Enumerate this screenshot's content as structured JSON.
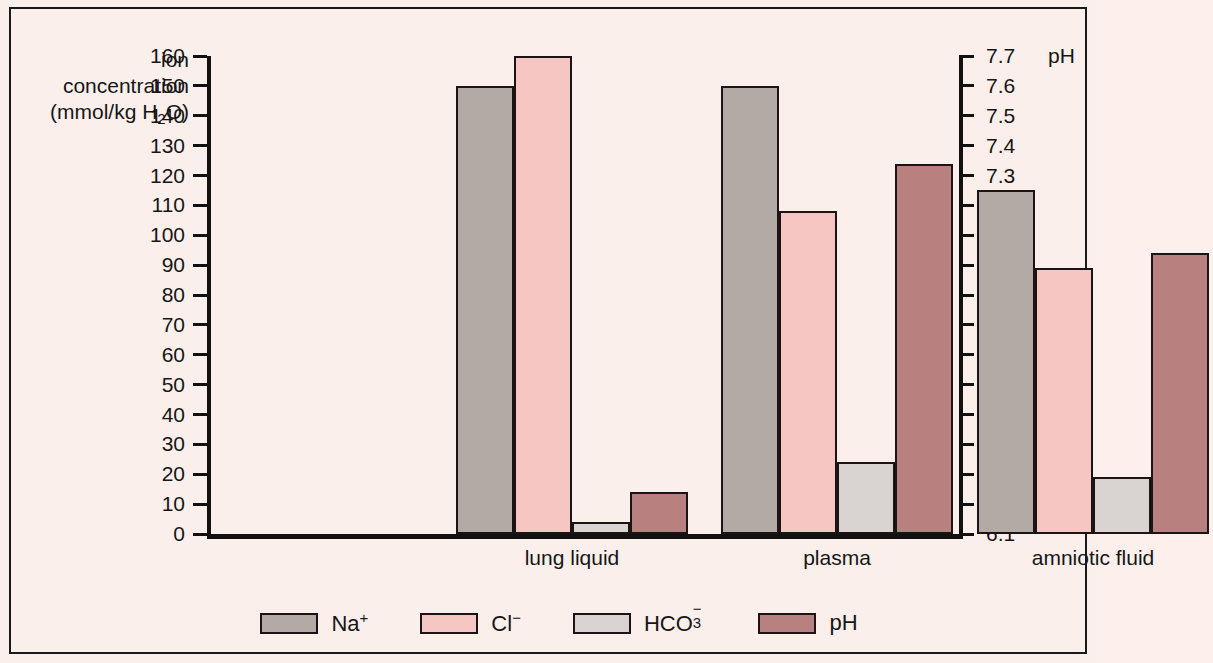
{
  "axes": {
    "left_label_line1": "ion",
    "left_label_line2": "concentration",
    "left_label_line3_pre": "(mmol/kg H",
    "left_label_line3_sub": "2",
    "left_label_line3_post": "O)",
    "right_label": "pH"
  },
  "legend": {
    "items": [
      {
        "name": "Na",
        "sup": "+",
        "sub": "",
        "color": "#b3aaa6"
      },
      {
        "name": "Cl",
        "sup": "−",
        "sub": "",
        "color": "#f6c6c3"
      },
      {
        "name": "HCO",
        "sup": "−",
        "sub": "3",
        "color": "#d9d4d2"
      },
      {
        "name": "pH",
        "sup": "",
        "sub": "",
        "color": "#b8807f"
      }
    ]
  },
  "chart_data": {
    "type": "bar",
    "title": "",
    "xlabel": "",
    "ylabel": "ion concentration (mmol/kg H2O)",
    "y2label": "pH",
    "grid": false,
    "legend_position": "bottom",
    "categories": [
      "lung liquid",
      "plasma",
      "amniotic fluid"
    ],
    "ylim": [
      0,
      160
    ],
    "y_ticks": [
      0,
      10,
      20,
      30,
      40,
      50,
      60,
      70,
      80,
      90,
      100,
      110,
      120,
      130,
      140,
      150,
      160
    ],
    "y_tick_labels": [
      "0",
      "10",
      "20",
      "30",
      "40",
      "50",
      "60",
      "70",
      "80",
      "90",
      "100",
      "110",
      "120",
      "130",
      "140",
      "150",
      "160"
    ],
    "y2lim": [
      6.1,
      7.7
    ],
    "y2_ticks": [
      6.1,
      6.2,
      6.3,
      6.4,
      6.5,
      6.6,
      6.7,
      6.8,
      6.9,
      7.0,
      7.1,
      7.2,
      7.3,
      7.4,
      7.5,
      7.6,
      7.7
    ],
    "y2_tick_labels": [
      "6.1",
      "6.2",
      "6.3",
      "6.4",
      "6.5",
      "6.6",
      "6.7",
      "6.8",
      "6.9",
      "7.0",
      "7.1",
      "7.2",
      "7.3",
      "7.4",
      "7.5",
      "7.6",
      "7.7"
    ],
    "series": [
      {
        "name": "Na+",
        "axis": "left",
        "color": "#b3aaa6",
        "values": [
          150,
          150,
          115
        ]
      },
      {
        "name": "Cl-",
        "axis": "left",
        "color": "#f6c6c3",
        "values": [
          160,
          108,
          89
        ]
      },
      {
        "name": "HCO3-",
        "axis": "left",
        "color": "#d9d4d2",
        "values": [
          4,
          24,
          19
        ]
      },
      {
        "name": "pH",
        "axis": "right",
        "color": "#b8807f",
        "values": [
          6.24,
          7.34,
          7.04
        ],
        "plotted_heights": [
          14,
          124,
          94
        ]
      }
    ]
  }
}
